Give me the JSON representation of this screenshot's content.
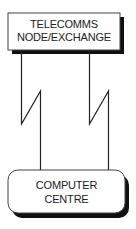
{
  "diagram": {
    "top_node": {
      "lines": [
        "TELECOMMS",
        "NODE/EXCHANGE"
      ],
      "shape": "rectangle-with-drop-shadow"
    },
    "bottom_node": {
      "lines": [
        "COMPUTER",
        "CENTRE"
      ],
      "shape": "rounded-rectangle-with-drop-shadow"
    },
    "links": [
      {
        "name": "left-link",
        "style": "lightning-zigzag"
      },
      {
        "name": "right-link",
        "style": "lightning-zigzag"
      }
    ],
    "colors": {
      "stroke": "#222222",
      "shadow": "#111111",
      "fill": "#ffffff"
    }
  }
}
